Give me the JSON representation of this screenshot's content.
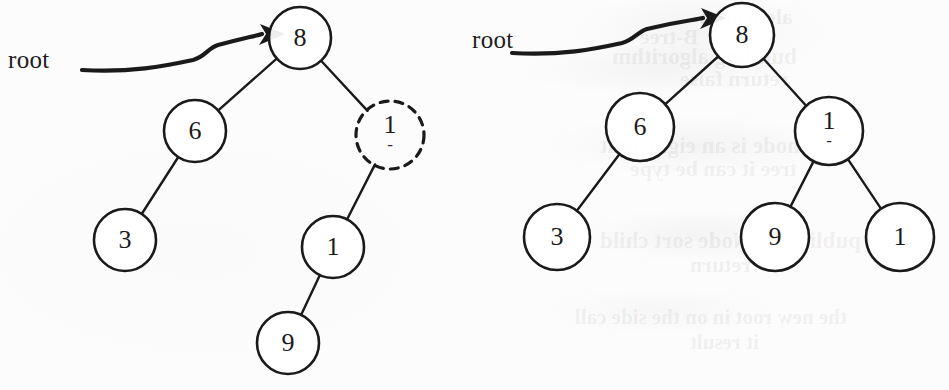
{
  "figure": {
    "kind": "binary-search-tree-diagram",
    "background_color": "#fcfcfc",
    "ink_color": "#1a1a1a",
    "panels": [
      {
        "id": "left",
        "root_label": "root",
        "nodes": [
          {
            "id": "L8",
            "label": "8",
            "sub": "",
            "cx": 300,
            "cy": 38,
            "r": 31,
            "style": "solid"
          },
          {
            "id": "L6",
            "label": "6",
            "sub": "",
            "cx": 195,
            "cy": 131,
            "r": 31,
            "style": "solid"
          },
          {
            "id": "L3",
            "label": "3",
            "sub": "",
            "cx": 125,
            "cy": 240,
            "r": 31,
            "style": "solid"
          },
          {
            "id": "L10",
            "label": "1",
            "sub": "-",
            "cx": 390,
            "cy": 135,
            "r": 34,
            "style": "dashed"
          },
          {
            "id": "L1",
            "label": "1",
            "sub": "",
            "cx": 333,
            "cy": 247,
            "r": 31,
            "style": "solid"
          },
          {
            "id": "L9",
            "label": "9",
            "sub": "",
            "cx": 288,
            "cy": 343,
            "r": 31,
            "style": "solid"
          }
        ],
        "edges": [
          {
            "from": "L8",
            "to": "L6"
          },
          {
            "from": "L6",
            "to": "L3"
          },
          {
            "from": "L8",
            "to": "L10"
          },
          {
            "from": "L10",
            "to": "L1"
          },
          {
            "from": "L1",
            "to": "L9"
          }
        ]
      },
      {
        "id": "right",
        "root_label": "root",
        "nodes": [
          {
            "id": "R8",
            "label": "8",
            "sub": "",
            "cx": 742,
            "cy": 35,
            "r": 32,
            "style": "solid"
          },
          {
            "id": "R6",
            "label": "6",
            "sub": "",
            "cx": 640,
            "cy": 127,
            "r": 34,
            "style": "solid"
          },
          {
            "id": "R3",
            "label": "3",
            "sub": "",
            "cx": 557,
            "cy": 237,
            "r": 33,
            "style": "solid"
          },
          {
            "id": "R10",
            "label": "1",
            "sub": "-",
            "cx": 829,
            "cy": 131,
            "r": 34,
            "style": "solid"
          },
          {
            "id": "R9",
            "label": "9",
            "sub": "",
            "cx": 775,
            "cy": 237,
            "r": 34,
            "style": "solid"
          },
          {
            "id": "R1",
            "label": "1",
            "sub": "",
            "cx": 900,
            "cy": 237,
            "r": 34,
            "style": "solid"
          }
        ],
        "edges": [
          {
            "from": "R8",
            "to": "R6"
          },
          {
            "from": "R6",
            "to": "R3"
          },
          {
            "from": "R8",
            "to": "R10"
          },
          {
            "from": "R10",
            "to": "R9"
          },
          {
            "from": "R10",
            "to": "R1"
          }
        ]
      }
    ]
  },
  "bleed_through": [
    {
      "text": "algorithm",
      "x": 700,
      "y": 4,
      "size": 22
    },
    {
      "text": "B-tree",
      "x": 640,
      "y": 24,
      "size": 22
    },
    {
      "text": "building algorithm",
      "x": 612,
      "y": 44,
      "size": 23
    },
    {
      "text": "return false",
      "x": 680,
      "y": 66,
      "size": 22
    },
    {
      "text": "node is an eight-unit",
      "x": 600,
      "y": 133,
      "size": 23
    },
    {
      "text": "tree it can be type",
      "x": 630,
      "y": 156,
      "size": 22
    },
    {
      "text": "public AVLNode sort child",
      "x": 600,
      "y": 228,
      "size": 23
    },
    {
      "text": "return",
      "x": 690,
      "y": 252,
      "size": 22
    },
    {
      "text": "the new root in on the side call",
      "x": 575,
      "y": 305,
      "size": 21
    },
    {
      "text": "it result",
      "x": 690,
      "y": 330,
      "size": 21
    }
  ]
}
